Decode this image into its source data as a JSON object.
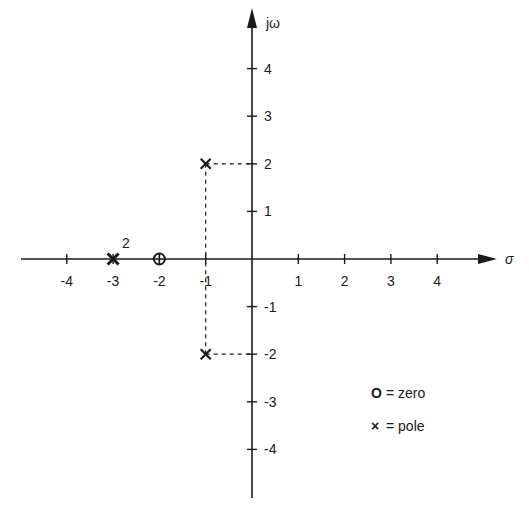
{
  "chart_data": {
    "type": "scatter",
    "title": "",
    "subtitle": "s-plane pole-zero plot",
    "xlabel": "σ",
    "ylabel": "jω",
    "xlim": [
      -5,
      5
    ],
    "ylim": [
      -5,
      5
    ],
    "grid": false,
    "x_ticks": [
      -4,
      -3,
      -2,
      -1,
      1,
      2,
      3,
      4
    ],
    "x_tick_labels": [
      "-4",
      "-3",
      "-2",
      "-1",
      "1",
      "2",
      "3",
      "4"
    ],
    "y_ticks": [
      4,
      3,
      2,
      1,
      -1,
      -2,
      -3,
      -4
    ],
    "y_tick_labels": [
      "4",
      "3",
      "2",
      "1",
      "-1",
      "-2",
      "-3",
      "-4"
    ],
    "series": [
      {
        "name": "zero",
        "marker": "O",
        "points": [
          {
            "x": -2,
            "y": 0,
            "multiplicity": 1
          }
        ]
      },
      {
        "name": "pole",
        "marker": "×",
        "points": [
          {
            "x": -3,
            "y": 0,
            "multiplicity": 2,
            "annotation": "2"
          },
          {
            "x": -1,
            "y": 2,
            "multiplicity": 1
          },
          {
            "x": -1,
            "y": -2,
            "multiplicity": 1
          }
        ]
      }
    ],
    "guides": [
      {
        "from": [
          -1,
          2
        ],
        "to": [
          0,
          2
        ],
        "style": "dashed"
      },
      {
        "from": [
          -1,
          2
        ],
        "to": [
          -1,
          0
        ],
        "style": "dashed"
      },
      {
        "from": [
          -1,
          -2
        ],
        "to": [
          0,
          -2
        ],
        "style": "dashed"
      },
      {
        "from": [
          -1,
          -2
        ],
        "to": [
          -1,
          0
        ],
        "style": "dashed"
      }
    ],
    "legend": {
      "position": "lower-right",
      "entries": [
        {
          "symbol": "O",
          "text": "= zero"
        },
        {
          "symbol": "×",
          "text": "= pole"
        }
      ]
    }
  },
  "axes": {
    "x_label": "σ",
    "y_label": "jω",
    "double_pole_annotation": "2"
  },
  "legend": {
    "zero_symbol": "O",
    "zero_text": "= zero",
    "pole_symbol": "×",
    "pole_text": "= pole"
  },
  "colors": {
    "ink": "#1a1a1a",
    "background": "#ffffff"
  }
}
